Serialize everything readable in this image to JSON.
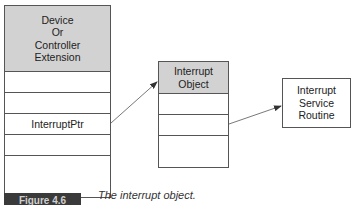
{
  "left_box": {
    "header_lines": [
      "Device",
      "Or",
      "Controller",
      "Extension"
    ],
    "rows": [
      "",
      "",
      "InterruptPtr",
      "",
      ""
    ]
  },
  "middle_box": {
    "header_lines": [
      "Interrupt",
      "Object"
    ],
    "rows": [
      "",
      "",
      ""
    ]
  },
  "right_box": {
    "lines": [
      "Interrupt",
      "Service",
      "Routine"
    ]
  },
  "figure": {
    "label": "Figure 4.6",
    "caption": "The interrupt object."
  },
  "colors": {
    "header_fill": "#d2d2d2",
    "border": "#555555",
    "label_bg": "#3a3a3a"
  }
}
